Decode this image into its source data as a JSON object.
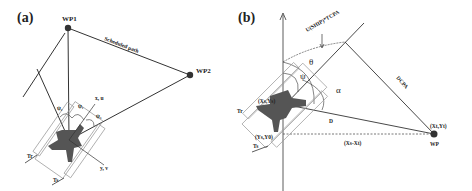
{
  "panel_a": {
    "label": "(a)",
    "waypoints": [
      {
        "name": "WP1",
        "x": 68,
        "y": 28
      },
      {
        "name": "WP2",
        "x": 190,
        "y": 75
      }
    ],
    "path_label": "Scheduled path",
    "angles": [
      "ψ₂",
      "ψ₁",
      "ψ₃"
    ],
    "axis_x_label": "x, u",
    "axis_y_label": "y, v",
    "thruster_labels": [
      "Tr",
      "Ts"
    ]
  },
  "panel_b": {
    "label": "(b)",
    "ship_position": "(Xš,Yš)",
    "ship_position_label": "(Xs,Ys)",
    "y_axis_point": "(Ys,Y0)",
    "target_label": "WP",
    "target_coords": "(Xt,Yt)",
    "dx_label": "(Xs-Xt)",
    "distance_label": "D",
    "dcpa_label": "DCPA",
    "tcpa_label": "U(SHIP)*TCPA",
    "angles": {
      "theta": "θ",
      "psi": "ψ",
      "alpha": "α"
    },
    "thruster_labels": [
      "Tr",
      "Ts"
    ]
  },
  "colors": {
    "line": "#333333",
    "ship": "#555555",
    "waypoint": "#333333",
    "outline": "#999999"
  }
}
